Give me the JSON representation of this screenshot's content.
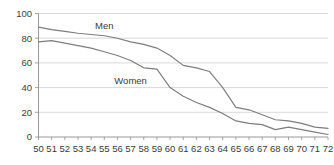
{
  "chart_data": {
    "type": "line",
    "title": "",
    "subtitle": "",
    "xlabel": "",
    "ylabel": "",
    "x": [
      50,
      51,
      52,
      53,
      54,
      55,
      56,
      57,
      58,
      59,
      60,
      61,
      62,
      63,
      64,
      65,
      66,
      67,
      68,
      69,
      70,
      71,
      72
    ],
    "xlim": [
      50,
      72
    ],
    "ylim": [
      0,
      100
    ],
    "yticks": [
      0,
      20,
      40,
      60,
      80,
      100
    ],
    "xticks": [
      50,
      51,
      52,
      53,
      54,
      55,
      56,
      57,
      58,
      59,
      60,
      61,
      62,
      63,
      64,
      65,
      66,
      67,
      68,
      69,
      70,
      71,
      72
    ],
    "ytick_labels": [
      "0",
      "20",
      "40",
      "60",
      "80",
      "100"
    ],
    "xtick_labels": [
      "50",
      "51",
      "52",
      "53",
      "54",
      "55",
      "56",
      "57",
      "58",
      "59",
      "60",
      "61",
      "62",
      "63",
      "64",
      "65",
      "66",
      "67",
      "68",
      "69",
      "70",
      "71",
      "72"
    ],
    "grid": true,
    "grid_axis": "y",
    "legend": "inline-labels",
    "series": [
      {
        "name": "Men",
        "color": "#7d7d7d",
        "label_x": 55,
        "label_y": 90,
        "values": [
          89,
          87,
          85.5,
          84,
          83,
          82,
          80,
          77,
          75,
          72,
          66,
          58,
          56,
          53,
          40,
          24,
          22,
          18,
          14,
          13,
          11,
          8,
          7
        ]
      },
      {
        "name": "Women",
        "color": "#7d7d7d",
        "label_x": 57,
        "label_y": 46,
        "values": [
          77,
          78,
          76,
          74,
          72,
          69,
          66,
          62,
          56,
          55,
          40,
          33,
          28,
          24,
          19,
          13,
          11,
          10,
          6,
          8,
          6,
          4,
          2
        ]
      }
    ]
  },
  "axes": {
    "y_axis_name": "value-axis",
    "x_axis_name": "age-axis"
  }
}
